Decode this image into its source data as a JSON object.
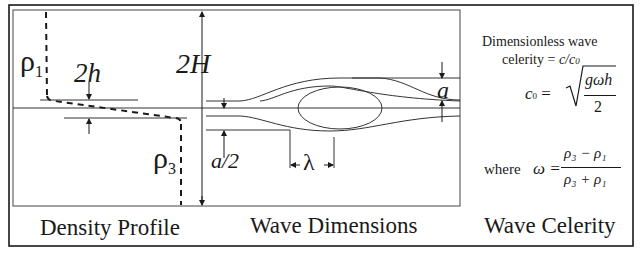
{
  "panels": {
    "density_profile": {
      "caption": "Density Profile",
      "rho_upper": {
        "symbol": "ρ",
        "sub": "1"
      },
      "rho_lower": {
        "symbol": "ρ",
        "sub": "3"
      },
      "thickness_label": "2h"
    },
    "wave_dimensions": {
      "caption": "Wave Dimensions",
      "depth_label": "2H",
      "amplitude_label": "a",
      "half_amplitude_label": "a/2",
      "wavelength_label": "λ"
    },
    "wave_celerity": {
      "caption": "Wave Celerity",
      "description_line1": "Dimensionless wave",
      "description_line2_prefix": "celerity = ",
      "description_line2_expr": "c/c",
      "description_line2_sub": "0",
      "c0_lhs": "c",
      "c0_lhs_sub": "0",
      "c0_equals": " =",
      "c0_numerator": "gωh",
      "c0_denominator": "2",
      "where_label": "where",
      "omega_lhs": "ω =",
      "omega_numerator": "ρ₃ − ρ₁",
      "omega_denominator": "ρ₃ + ρ₁"
    }
  },
  "colors": {
    "line": "#1a1a1a",
    "thin_line": "#333333",
    "background": "#ffffff"
  }
}
